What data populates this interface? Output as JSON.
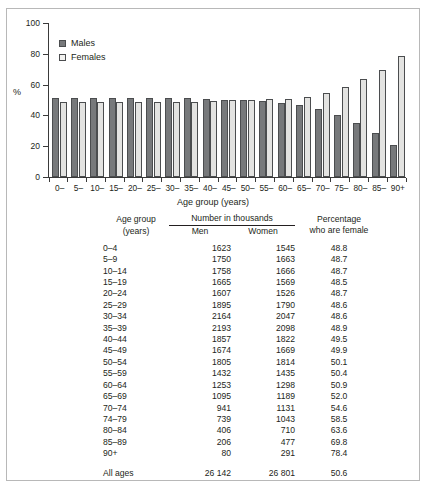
{
  "chart_data": {
    "type": "bar",
    "title": "",
    "xlabel": "Age group (years)",
    "ylabel": "%",
    "ylim": [
      0,
      100
    ],
    "yticks": [
      0,
      20,
      40,
      60,
      80,
      100
    ],
    "grid": false,
    "legend_position": "top-left",
    "categories": [
      "0–",
      "5–",
      "10–",
      "15–",
      "20–",
      "25–",
      "30–",
      "35–",
      "40–",
      "45–",
      "50–",
      "55–",
      "60–",
      "65–",
      "70–",
      "75–",
      "80–",
      "85–",
      "90+"
    ],
    "series": [
      {
        "name": "Males",
        "color": "#77797b",
        "values": [
          51.2,
          51.3,
          51.3,
          51.5,
          51.3,
          51.4,
          51.4,
          51.1,
          50.5,
          50.1,
          49.9,
          49.6,
          48.0,
          46.5,
          44.0,
          40.3,
          35.3,
          28.7,
          20.6
        ]
      },
      {
        "name": "Females",
        "color": "#e3e3e1",
        "values": [
          48.8,
          48.7,
          48.7,
          48.5,
          48.7,
          48.6,
          48.6,
          48.9,
          49.5,
          49.9,
          50.1,
          50.4,
          50.9,
          52.0,
          54.6,
          58.5,
          63.6,
          69.8,
          78.4
        ]
      }
    ]
  },
  "legend": {
    "items": [
      {
        "label": "Males",
        "swatch": "male-swatch"
      },
      {
        "label": "Females",
        "swatch": "female-swatch"
      }
    ]
  },
  "table": {
    "headers": {
      "age_group": "Age group",
      "age_group_unit": "(years)",
      "number_group": "Number in thousands",
      "men": "Men",
      "women": "Women",
      "percentage_line1": "Percentage",
      "percentage_line2": "who are female"
    },
    "rows": [
      {
        "age": "0–4",
        "men": "1623",
        "women": "1545",
        "pct": "48.8"
      },
      {
        "age": "5–9",
        "men": "1750",
        "women": "1663",
        "pct": "48.7"
      },
      {
        "age": "10–14",
        "men": "1758",
        "women": "1666",
        "pct": "48.7"
      },
      {
        "age": "15–19",
        "men": "1665",
        "women": "1569",
        "pct": "48.5"
      },
      {
        "age": "20–24",
        "men": "1607",
        "women": "1526",
        "pct": "48.7"
      },
      {
        "age": "25–29",
        "men": "1895",
        "women": "1790",
        "pct": "48.6"
      },
      {
        "age": "30–34",
        "men": "2164",
        "women": "2047",
        "pct": "48.6"
      },
      {
        "age": "35–39",
        "men": "2193",
        "women": "2098",
        "pct": "48.9"
      },
      {
        "age": "40–44",
        "men": "1857",
        "women": "1822",
        "pct": "49.5"
      },
      {
        "age": "45–49",
        "men": "1674",
        "women": "1669",
        "pct": "49.9"
      },
      {
        "age": "50–54",
        "men": "1805",
        "women": "1814",
        "pct": "50.1"
      },
      {
        "age": "55–59",
        "men": "1432",
        "women": "1435",
        "pct": "50.4"
      },
      {
        "age": "60–64",
        "men": "1253",
        "women": "1298",
        "pct": "50.9"
      },
      {
        "age": "65–69",
        "men": "1095",
        "women": "1189",
        "pct": "52.0"
      },
      {
        "age": "70–74",
        "men": "941",
        "women": "1131",
        "pct": "54.6"
      },
      {
        "age": "74–79",
        "men": "739",
        "women": "1043",
        "pct": "58.5"
      },
      {
        "age": "80–84",
        "men": "406",
        "women": "710",
        "pct": "63.6"
      },
      {
        "age": "85–89",
        "men": "206",
        "women": "477",
        "pct": "69.8"
      },
      {
        "age": "90+",
        "men": "80",
        "women": "291",
        "pct": "78.4"
      }
    ],
    "total_row": {
      "age": "All ages",
      "men": "26 142",
      "women": "26 801",
      "pct": "50.6"
    }
  }
}
